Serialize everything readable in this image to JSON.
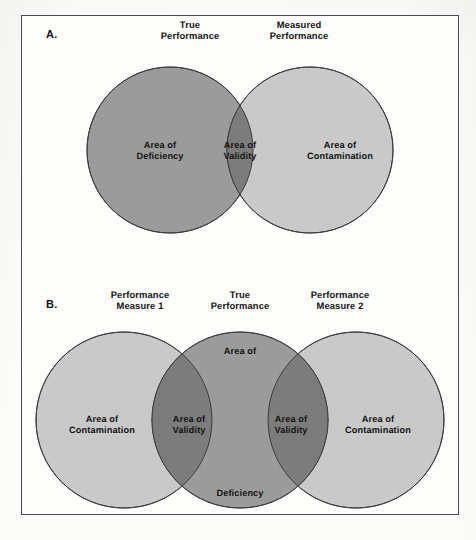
{
  "figure": {
    "background_color": "#fdfdfc",
    "frame_color": "#4a4a4a"
  },
  "palette": {
    "light_gray": "#c9c9c9",
    "medium_gray": "#9b9b9b",
    "dark_gray": "#7c7c7c",
    "outline": "#3d3d3d",
    "text": "#141414"
  },
  "panels": [
    {
      "letter": "A.",
      "top_labels": [
        {
          "text": "True\nPerformance",
          "x": 190,
          "y": 19
        },
        {
          "text": "Measured\nPerformance",
          "x": 299,
          "y": 19
        }
      ],
      "region_labels": [
        {
          "text": "Area of\nDeficiency",
          "x": 160,
          "y": 140
        },
        {
          "text": "Area of\nValidity",
          "x": 240,
          "y": 140
        },
        {
          "text": "Area of\nContamination",
          "x": 340,
          "y": 140
        }
      ],
      "circles": [
        {
          "name": "true-performance-circle",
          "cx": 170,
          "cy": 150,
          "r": 83,
          "fill": "#9b9b9b"
        },
        {
          "name": "measured-performance-circle",
          "cx": 310,
          "cy": 150,
          "r": 83,
          "fill": "#c9c9c9"
        }
      ],
      "overlap_fill": "#7c7c7c"
    },
    {
      "letter": "B.",
      "top_labels": [
        {
          "text": "Performance\nMeasure 1",
          "x": 140,
          "y": 289
        },
        {
          "text": "True\nPerformance",
          "x": 240,
          "y": 289
        },
        {
          "text": "Performance\nMeasure 2",
          "x": 340,
          "y": 289
        }
      ],
      "region_labels": [
        {
          "text": "Area of\nContamination",
          "x": 102,
          "y": 414
        },
        {
          "text": "Area of\nValidity",
          "x": 189,
          "y": 414
        },
        {
          "text": "Area of",
          "x": 240,
          "y": 346
        },
        {
          "text": "Area of\nValidity",
          "x": 291,
          "y": 414
        },
        {
          "text": "Area of\nContamination",
          "x": 378,
          "y": 414
        },
        {
          "text": "Deficiency",
          "x": 240,
          "y": 488
        }
      ],
      "circles": [
        {
          "name": "performance-measure-1-circle",
          "cx": 124,
          "cy": 420,
          "r": 88,
          "fill": "#c9c9c9"
        },
        {
          "name": "true-performance-circle",
          "cx": 240,
          "cy": 420,
          "r": 88,
          "fill": "#9b9b9b"
        },
        {
          "name": "performance-measure-2-circle",
          "cx": 356,
          "cy": 420,
          "r": 88,
          "fill": "#c9c9c9"
        }
      ],
      "overlap_fill": "#7c7c7c"
    }
  ]
}
